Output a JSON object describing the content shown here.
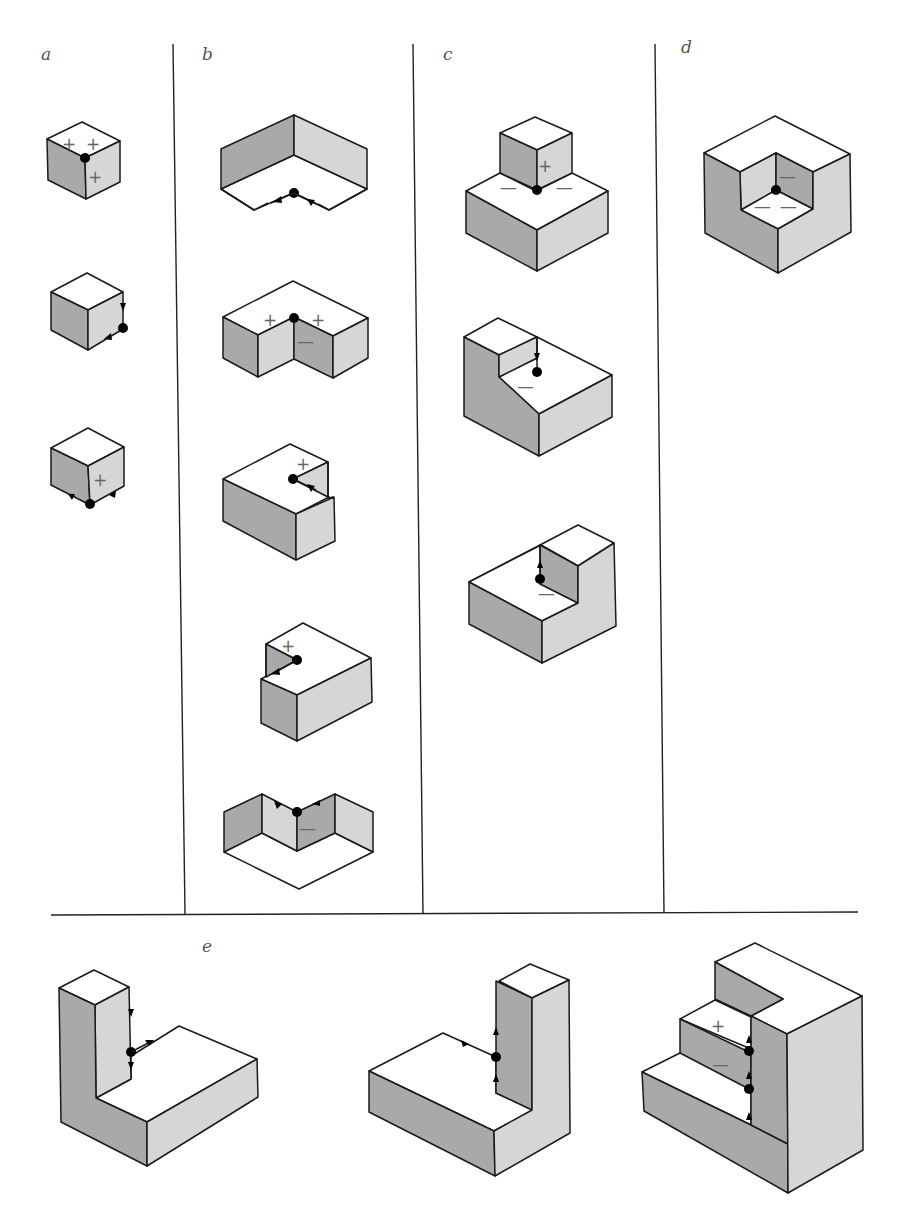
{
  "panels": {
    "a": {
      "label": "a"
    },
    "b": {
      "label": "b"
    },
    "c": {
      "label": "c"
    },
    "d": {
      "label": "d"
    },
    "e": {
      "label": "e"
    }
  },
  "marks": {
    "plus": "+",
    "minus": "—"
  },
  "colors": {
    "top_face": "#ffffff",
    "dark_face": "#a9a9a9",
    "light_face": "#d6d6d6",
    "edge": "#1a1a1a",
    "vertex_dot": "#000000"
  },
  "figures": [
    {
      "panel": "a",
      "index": 1,
      "vertex_labels": [
        "+",
        "+",
        "+"
      ]
    },
    {
      "panel": "a",
      "index": 2,
      "vertex_labels": [],
      "arrows": 2
    },
    {
      "panel": "a",
      "index": 3,
      "vertex_labels": [
        "+"
      ],
      "arrows": 2
    },
    {
      "panel": "b",
      "index": 1,
      "vertex_labels": [],
      "arrows": 2
    },
    {
      "panel": "b",
      "index": 2,
      "vertex_labels": [
        "+",
        "+",
        "—"
      ]
    },
    {
      "panel": "b",
      "index": 3,
      "vertex_labels": [
        "+"
      ],
      "arrows": 1
    },
    {
      "panel": "b",
      "index": 4,
      "vertex_labels": [
        "+"
      ],
      "arrows": 1
    },
    {
      "panel": "b",
      "index": 5,
      "vertex_labels": [
        "—"
      ],
      "arrows": 2
    },
    {
      "panel": "c",
      "index": 1,
      "vertex_labels": [
        "+",
        "—",
        "—"
      ]
    },
    {
      "panel": "c",
      "index": 2,
      "vertex_labels": [
        "—"
      ],
      "arrows": 1
    },
    {
      "panel": "c",
      "index": 3,
      "vertex_labels": [
        "—"
      ],
      "arrows": 1
    },
    {
      "panel": "d",
      "index": 1,
      "vertex_labels": [
        "—",
        "—",
        "—"
      ]
    },
    {
      "panel": "e",
      "index": 1,
      "vertex_labels": [],
      "arrows": 3
    },
    {
      "panel": "e",
      "index": 2,
      "vertex_labels": [],
      "arrows": 3
    },
    {
      "panel": "e",
      "index": 3,
      "vertex_labels": [
        "+",
        "—"
      ],
      "arrows": 3
    }
  ]
}
